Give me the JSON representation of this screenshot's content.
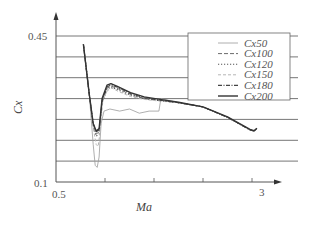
{
  "chart_data": {
    "type": "line",
    "title": "",
    "xlabel": "Ma",
    "ylabel": "Cx",
    "xlim": [
      0.5,
      3
    ],
    "ylim": [
      0.1,
      0.45
    ],
    "x_tick_labels": [
      "0.5",
      "3"
    ],
    "x_minor_ticks": [
      1.0,
      1.5,
      2.0,
      2.5
    ],
    "y_tick_labels": [
      "0.1",
      "0.45"
    ],
    "y_gridlines": [
      0.15,
      0.2,
      0.25,
      0.3,
      0.35,
      0.4,
      0.45
    ],
    "grid": "horizontal",
    "legend_position": "upper right",
    "series": [
      {
        "name": "Cx50",
        "style": "solid-thin",
        "color": "#9a9a9a",
        "points": [
          [
            0.78,
            0.43
          ],
          [
            0.84,
            0.31
          ],
          [
            0.88,
            0.19
          ],
          [
            0.9,
            0.14
          ],
          [
            0.92,
            0.135
          ],
          [
            0.94,
            0.16
          ],
          [
            0.96,
            0.24
          ],
          [
            0.99,
            0.27
          ],
          [
            1.05,
            0.275
          ],
          [
            1.15,
            0.27
          ],
          [
            1.25,
            0.275
          ],
          [
            1.35,
            0.265
          ],
          [
            1.45,
            0.27
          ],
          [
            1.55,
            0.27
          ],
          [
            1.57,
            0.3
          ],
          [
            1.75,
            0.29
          ],
          [
            2.0,
            0.28
          ],
          [
            2.25,
            0.255
          ],
          [
            2.48,
            0.225
          ],
          [
            2.52,
            0.222
          ],
          [
            2.55,
            0.228
          ]
        ]
      },
      {
        "name": "Cx100",
        "style": "dashed",
        "color": "#6a6a6a",
        "points": [
          [
            0.78,
            0.43
          ],
          [
            0.84,
            0.31
          ],
          [
            0.88,
            0.24
          ],
          [
            0.91,
            0.215
          ],
          [
            0.94,
            0.22
          ],
          [
            0.97,
            0.29
          ],
          [
            1.02,
            0.325
          ],
          [
            1.06,
            0.33
          ],
          [
            1.12,
            0.325
          ],
          [
            1.26,
            0.31
          ],
          [
            1.4,
            0.3
          ],
          [
            1.56,
            0.295
          ],
          [
            1.75,
            0.29
          ],
          [
            2.0,
            0.28
          ],
          [
            2.25,
            0.255
          ],
          [
            2.48,
            0.225
          ],
          [
            2.52,
            0.222
          ],
          [
            2.55,
            0.228
          ]
        ]
      },
      {
        "name": "Cx120",
        "style": "dotted",
        "color": "#555555",
        "points": [
          [
            0.78,
            0.43
          ],
          [
            0.84,
            0.31
          ],
          [
            0.88,
            0.235
          ],
          [
            0.91,
            0.21
          ],
          [
            0.94,
            0.215
          ],
          [
            0.97,
            0.29
          ],
          [
            1.02,
            0.322
          ],
          [
            1.06,
            0.328
          ],
          [
            1.12,
            0.322
          ],
          [
            1.26,
            0.308
          ],
          [
            1.4,
            0.3
          ],
          [
            1.56,
            0.295
          ],
          [
            1.75,
            0.29
          ],
          [
            2.0,
            0.28
          ],
          [
            2.25,
            0.255
          ],
          [
            2.48,
            0.225
          ],
          [
            2.52,
            0.222
          ],
          [
            2.55,
            0.228
          ]
        ]
      },
      {
        "name": "Cx150",
        "style": "dashed-light",
        "color": "#b5b5b5",
        "points": [
          [
            0.78,
            0.43
          ],
          [
            0.84,
            0.31
          ],
          [
            0.88,
            0.23
          ],
          [
            0.91,
            0.19
          ],
          [
            0.93,
            0.185
          ],
          [
            0.95,
            0.22
          ],
          [
            0.98,
            0.3
          ],
          [
            1.03,
            0.32
          ],
          [
            1.07,
            0.325
          ],
          [
            1.13,
            0.318
          ],
          [
            1.26,
            0.305
          ],
          [
            1.4,
            0.298
          ],
          [
            1.56,
            0.294
          ],
          [
            1.75,
            0.29
          ],
          [
            2.0,
            0.28
          ],
          [
            2.25,
            0.255
          ],
          [
            2.48,
            0.225
          ],
          [
            2.52,
            0.222
          ],
          [
            2.55,
            0.228
          ]
        ]
      },
      {
        "name": "Cx180",
        "style": "dash-dot",
        "color": "#444444",
        "points": [
          [
            0.78,
            0.43
          ],
          [
            0.84,
            0.31
          ],
          [
            0.88,
            0.24
          ],
          [
            0.91,
            0.22
          ],
          [
            0.94,
            0.225
          ],
          [
            0.97,
            0.295
          ],
          [
            1.02,
            0.328
          ],
          [
            1.06,
            0.333
          ],
          [
            1.12,
            0.328
          ],
          [
            1.26,
            0.312
          ],
          [
            1.4,
            0.302
          ],
          [
            1.56,
            0.296
          ],
          [
            1.75,
            0.29
          ],
          [
            2.0,
            0.28
          ],
          [
            2.25,
            0.255
          ],
          [
            2.48,
            0.225
          ],
          [
            2.52,
            0.222
          ],
          [
            2.55,
            0.228
          ]
        ]
      },
      {
        "name": "Cx200",
        "style": "solid-thick",
        "color": "#333333",
        "points": [
          [
            0.78,
            0.43
          ],
          [
            0.84,
            0.31
          ],
          [
            0.88,
            0.24
          ],
          [
            0.91,
            0.222
          ],
          [
            0.94,
            0.228
          ],
          [
            0.97,
            0.3
          ],
          [
            1.02,
            0.332
          ],
          [
            1.06,
            0.336
          ],
          [
            1.12,
            0.33
          ],
          [
            1.26,
            0.314
          ],
          [
            1.4,
            0.304
          ],
          [
            1.56,
            0.298
          ],
          [
            1.75,
            0.291
          ],
          [
            2.0,
            0.28
          ],
          [
            2.25,
            0.256
          ],
          [
            2.48,
            0.226
          ],
          [
            2.52,
            0.223
          ],
          [
            2.55,
            0.229
          ]
        ]
      }
    ]
  },
  "axes": {
    "x_label": "Ma",
    "y_label": "Cx",
    "x_min_label": "0.5",
    "x_max_label": "3",
    "y_min_label": "0.1",
    "y_max_label": "0.45"
  },
  "legend": {
    "items": [
      "Cx50",
      "Cx100",
      "Cx120",
      "Cx150",
      "Cx180",
      "Cx200"
    ]
  }
}
